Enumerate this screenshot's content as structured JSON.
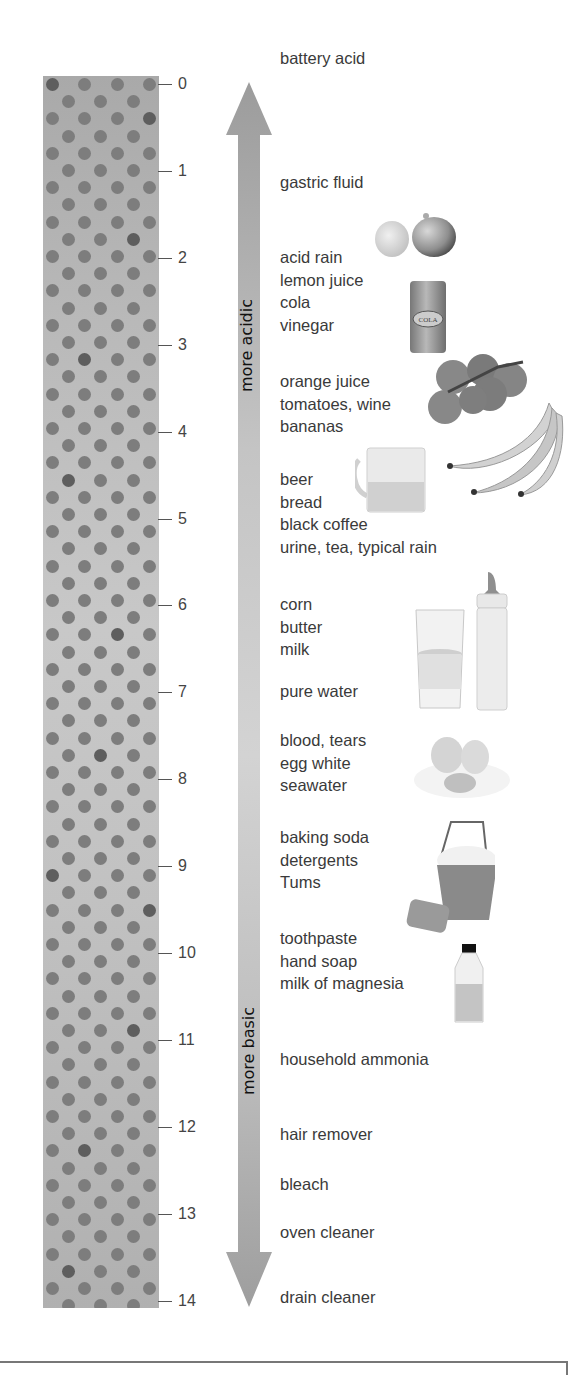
{
  "diagram": {
    "scale": {
      "min": 0,
      "max": 14,
      "ticks": [
        "0",
        "1",
        "2",
        "3",
        "4",
        "5",
        "6",
        "7",
        "8",
        "9",
        "10",
        "11",
        "12",
        "13",
        "14"
      ]
    },
    "arrow": {
      "top_label": "more acidic",
      "bottom_label": "more basic"
    },
    "groups": [
      {
        "ph": 0,
        "lines": [
          "battery acid"
        ]
      },
      {
        "ph": 1,
        "lines": [
          "gastric fluid"
        ]
      },
      {
        "ph": 2,
        "lines": [
          "acid rain",
          "lemon juice",
          "cola",
          "vinegar"
        ]
      },
      {
        "ph": 3,
        "lines": [
          "orange juice",
          "tomatoes, wine",
          "bananas"
        ]
      },
      {
        "ph": 4,
        "lines": [
          "beer",
          "bread",
          "black coffee",
          "urine, tea, typical rain"
        ]
      },
      {
        "ph": 6,
        "lines": [
          "corn",
          "butter",
          "milk"
        ]
      },
      {
        "ph": 7,
        "lines": [
          "pure water"
        ]
      },
      {
        "ph": 7.5,
        "lines": [
          "blood, tears",
          "egg white",
          "seawater"
        ]
      },
      {
        "ph": 8.5,
        "lines": [
          "baking soda",
          "detergents",
          "Tums"
        ]
      },
      {
        "ph": 10,
        "lines": [
          "toothpaste",
          "hand soap",
          "milk of magnesia"
        ]
      },
      {
        "ph": 11,
        "lines": [
          "household ammonia"
        ]
      },
      {
        "ph": 12,
        "lines": [
          "hair remover"
        ]
      },
      {
        "ph": 12.5,
        "lines": [
          "bleach"
        ]
      },
      {
        "ph": 13,
        "lines": [
          "oven cleaner"
        ]
      },
      {
        "ph": 14,
        "lines": [
          "drain cleaner"
        ]
      }
    ],
    "illustrations": {
      "lemon": "lemon-icon",
      "cola": "cola-can-icon",
      "cola_label": "COLA",
      "tomatoes": "tomatoes-icon",
      "bananas": "bananas-icon",
      "beer": "beer-mug-icon",
      "water_glass": "water-glass-icon",
      "milk_bottle": "baby-bottle-icon",
      "egg": "broken-egg-icon",
      "bucket": "soapy-bucket-icon",
      "sponge": "sponge-icon",
      "bottle": "medicine-bottle-icon"
    },
    "colors": {
      "column": "#bdbdbd",
      "dot": "#7d7d7d",
      "arrow": "#a8a8a8",
      "text": "#3a3a3a"
    }
  }
}
